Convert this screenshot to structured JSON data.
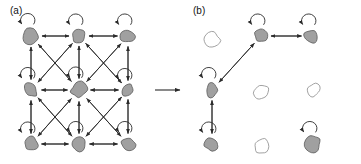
{
  "figure": {
    "width": 361,
    "height": 164,
    "background": "#ffffff",
    "stroke_color": "#2b2b2b",
    "node_fill_active": "#a0a0a0",
    "node_fill_inactive": "#ffffff",
    "node_stroke": "#5a5a5a",
    "arrow_color": "#2b2b2b"
  },
  "panels": [
    {
      "id": "a",
      "label": "(a)",
      "label_x": 10,
      "label_y": 14,
      "description": "fully connected 3x3 lattice of active states with self-loops",
      "origin_x": 0,
      "nodes": [
        {
          "id": "a-r0c0",
          "name": "node-top-left",
          "row": 0,
          "col": 0,
          "cx": 31,
          "cy": 36,
          "active": true,
          "self_loop": true,
          "shape": "blob-1",
          "rx": 8.5,
          "ry": 8.0
        },
        {
          "id": "a-r0c1",
          "name": "node-top-middle",
          "row": 0,
          "col": 1,
          "cx": 79,
          "cy": 36,
          "active": true,
          "self_loop": true,
          "shape": "blob-2",
          "rx": 7.5,
          "ry": 7.5
        },
        {
          "id": "a-r0c2",
          "name": "node-top-right",
          "row": 0,
          "col": 2,
          "cx": 128,
          "cy": 36,
          "active": true,
          "self_loop": true,
          "shape": "blob-3",
          "rx": 8.0,
          "ry": 7.5
        },
        {
          "id": "a-r1c0",
          "name": "node-middle-left",
          "row": 1,
          "col": 0,
          "cx": 31,
          "cy": 90,
          "active": true,
          "self_loop": true,
          "shape": "blob-4",
          "rx": 7.0,
          "ry": 8.0
        },
        {
          "id": "a-r1c1",
          "name": "node-center",
          "row": 1,
          "col": 1,
          "cx": 79,
          "cy": 90,
          "active": true,
          "self_loop": true,
          "shape": "blob-5",
          "rx": 9.0,
          "ry": 8.5
        },
        {
          "id": "a-r1c2",
          "name": "node-middle-right",
          "row": 1,
          "col": 2,
          "cx": 128,
          "cy": 90,
          "active": true,
          "self_loop": true,
          "shape": "blob-6",
          "rx": 7.0,
          "ry": 7.0
        },
        {
          "id": "a-r2c0",
          "name": "node-bottom-left",
          "row": 2,
          "col": 0,
          "cx": 31,
          "cy": 144,
          "active": true,
          "self_loop": true,
          "shape": "blob-7",
          "rx": 8.0,
          "ry": 7.5
        },
        {
          "id": "a-r2c1",
          "name": "node-bottom-middle",
          "row": 2,
          "col": 1,
          "cx": 79,
          "cy": 144,
          "active": true,
          "self_loop": true,
          "shape": "blob-8",
          "rx": 7.5,
          "ry": 8.0
        },
        {
          "id": "a-r2c2",
          "name": "node-bottom-right",
          "row": 2,
          "col": 2,
          "cx": 128,
          "cy": 144,
          "active": true,
          "self_loop": true,
          "shape": "blob-9",
          "rx": 8.0,
          "ry": 8.0
        }
      ],
      "edges": [
        {
          "from": "a-r0c0",
          "to": "a-r0c1",
          "kind": "horizontal",
          "bidirectional": true
        },
        {
          "from": "a-r0c1",
          "to": "a-r0c2",
          "kind": "horizontal",
          "bidirectional": true
        },
        {
          "from": "a-r1c0",
          "to": "a-r1c1",
          "kind": "horizontal",
          "bidirectional": true
        },
        {
          "from": "a-r1c1",
          "to": "a-r1c2",
          "kind": "horizontal",
          "bidirectional": true
        },
        {
          "from": "a-r2c0",
          "to": "a-r2c1",
          "kind": "horizontal",
          "bidirectional": true
        },
        {
          "from": "a-r2c1",
          "to": "a-r2c2",
          "kind": "horizontal",
          "bidirectional": true
        },
        {
          "from": "a-r0c0",
          "to": "a-r1c0",
          "kind": "vertical",
          "bidirectional": true
        },
        {
          "from": "a-r1c0",
          "to": "a-r2c0",
          "kind": "vertical",
          "bidirectional": true
        },
        {
          "from": "a-r0c1",
          "to": "a-r1c1",
          "kind": "vertical",
          "bidirectional": true
        },
        {
          "from": "a-r1c1",
          "to": "a-r2c1",
          "kind": "vertical",
          "bidirectional": true
        },
        {
          "from": "a-r0c2",
          "to": "a-r1c2",
          "kind": "vertical",
          "bidirectional": true
        },
        {
          "from": "a-r1c2",
          "to": "a-r2c2",
          "kind": "vertical",
          "bidirectional": true
        },
        {
          "from": "a-r0c0",
          "to": "a-r1c1",
          "kind": "diagonal",
          "bidirectional": true
        },
        {
          "from": "a-r1c1",
          "to": "a-r2c2",
          "kind": "diagonal",
          "bidirectional": true
        },
        {
          "from": "a-r0c1",
          "to": "a-r1c0",
          "kind": "diagonal",
          "bidirectional": true
        },
        {
          "from": "a-r0c1",
          "to": "a-r1c2",
          "kind": "diagonal",
          "bidirectional": true
        },
        {
          "from": "a-r1c0",
          "to": "a-r2c1",
          "kind": "diagonal",
          "bidirectional": true
        },
        {
          "from": "a-r1c2",
          "to": "a-r2c1",
          "kind": "diagonal",
          "bidirectional": true
        },
        {
          "from": "a-r0c2",
          "to": "a-r1c1",
          "kind": "diagonal",
          "bidirectional": true
        },
        {
          "from": "a-r1c1",
          "to": "a-r2c0",
          "kind": "diagonal",
          "bidirectional": true
        }
      ]
    },
    {
      "id": "b",
      "label": "(b)",
      "label_x": 193,
      "label_y": 14,
      "description": "pruned lattice: five active states retained with three surviving transitions",
      "origin_x": 185,
      "nodes": [
        {
          "id": "b-r0c0",
          "name": "node-top-left",
          "row": 0,
          "col": 0,
          "cx": 212,
          "cy": 40,
          "active": false,
          "self_loop": false,
          "shape": "blob-1",
          "rx": 8.5,
          "ry": 8.0
        },
        {
          "id": "b-r0c1",
          "name": "node-top-middle",
          "row": 0,
          "col": 1,
          "cx": 261,
          "cy": 36,
          "active": true,
          "self_loop": true,
          "shape": "blob-2",
          "rx": 7.5,
          "ry": 7.5
        },
        {
          "id": "b-r0c2",
          "name": "node-top-right",
          "row": 0,
          "col": 2,
          "cx": 312,
          "cy": 36,
          "active": true,
          "self_loop": true,
          "shape": "blob-3",
          "rx": 8.0,
          "ry": 7.5
        },
        {
          "id": "b-r1c0",
          "name": "node-middle-left",
          "row": 1,
          "col": 0,
          "cx": 212,
          "cy": 90,
          "active": true,
          "self_loop": true,
          "shape": "blob-4",
          "rx": 7.0,
          "ry": 8.0
        },
        {
          "id": "b-r1c1",
          "name": "node-center",
          "row": 1,
          "col": 1,
          "cx": 262,
          "cy": 92,
          "active": false,
          "self_loop": false,
          "shape": "blob-5",
          "rx": 9.0,
          "ry": 8.5
        },
        {
          "id": "b-r1c2",
          "name": "node-middle-right",
          "row": 1,
          "col": 2,
          "cx": 313,
          "cy": 90,
          "active": false,
          "self_loop": false,
          "shape": "blob-6",
          "rx": 7.0,
          "ry": 7.0
        },
        {
          "id": "b-r2c0",
          "name": "node-bottom-left",
          "row": 2,
          "col": 0,
          "cx": 212,
          "cy": 144,
          "active": true,
          "self_loop": true,
          "shape": "blob-7",
          "rx": 8.0,
          "ry": 7.5
        },
        {
          "id": "b-r2c1",
          "name": "node-bottom-middle",
          "row": 2,
          "col": 1,
          "cx": 262,
          "cy": 146,
          "active": false,
          "self_loop": false,
          "shape": "blob-8",
          "rx": 7.5,
          "ry": 8.0
        },
        {
          "id": "b-r2c2",
          "name": "node-bottom-right",
          "row": 2,
          "col": 2,
          "cx": 313,
          "cy": 144,
          "active": true,
          "self_loop": true,
          "shape": "blob-9",
          "rx": 8.0,
          "ry": 8.0
        }
      ],
      "edges": [
        {
          "from": "b-r0c1",
          "to": "b-r0c2",
          "kind": "horizontal",
          "bidirectional": true
        },
        {
          "from": "b-r0c1",
          "to": "b-r1c0",
          "kind": "diagonal",
          "bidirectional": true
        },
        {
          "from": "b-r1c0",
          "to": "b-r2c0",
          "kind": "vertical",
          "bidirectional": true
        }
      ]
    }
  ],
  "transition_arrow": {
    "name": "panel-transition-arrow",
    "x1": 155,
    "y1": 90,
    "x2": 180,
    "y2": 90,
    "label": ""
  }
}
